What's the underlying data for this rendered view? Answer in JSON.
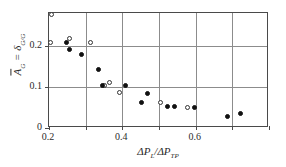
{
  "chart_data": {
    "type": "scatter",
    "title": "",
    "xlabel": "ΔP_L/ΔP_TP",
    "ylabel": "Ā_G = δ_G/G",
    "xlim": [
      0.2,
      0.8
    ],
    "ylim": [
      0.0,
      0.28
    ],
    "grid": true,
    "grid_x": [
      0.2,
      0.3,
      0.4,
      0.5,
      0.6,
      0.7,
      0.8
    ],
    "grid_y": [
      0.1,
      0.2
    ],
    "xticks": [
      0.2,
      0.4,
      0.6
    ],
    "xticklabels": [
      "0.2",
      "0.4",
      "0.6"
    ],
    "yticks": [
      0.0,
      0.1,
      0.2
    ],
    "yticklabels": [
      "0",
      "0.1",
      "0.2"
    ],
    "legend": "none",
    "series": [
      {
        "name": "open-circles",
        "marker": "open-circle",
        "color": "#333333",
        "points": [
          [
            0.206,
            0.277
          ],
          [
            0.205,
            0.207
          ],
          [
            0.255,
            0.218
          ],
          [
            0.312,
            0.207
          ],
          [
            0.352,
            0.104
          ],
          [
            0.365,
            0.11
          ],
          [
            0.392,
            0.087
          ],
          [
            0.503,
            0.062
          ],
          [
            0.578,
            0.051
          ]
        ]
      },
      {
        "name": "filled-circles",
        "marker": "filled-circle",
        "color": "#111111",
        "points": [
          [
            0.247,
            0.208
          ],
          [
            0.256,
            0.192
          ],
          [
            0.289,
            0.18
          ],
          [
            0.335,
            0.142
          ],
          [
            0.345,
            0.103
          ],
          [
            0.408,
            0.103
          ],
          [
            0.453,
            0.062
          ],
          [
            0.468,
            0.085
          ],
          [
            0.523,
            0.052
          ],
          [
            0.543,
            0.052
          ],
          [
            0.598,
            0.049
          ],
          [
            0.686,
            0.028
          ],
          [
            0.722,
            0.036
          ]
        ]
      }
    ]
  },
  "axis": {
    "xlabel_parts": {
      "delta1": "Δ",
      "p1": "P",
      "sub1": "L",
      "slash": "/",
      "delta2": "Δ",
      "p2": "P",
      "sub2": "TP"
    },
    "ylabel_parts": {
      "abar": "A",
      "sub_a": "G",
      "equals": "=",
      "delta": "δ",
      "sub_d": "G",
      "slash": "/",
      "g": "G"
    }
  }
}
